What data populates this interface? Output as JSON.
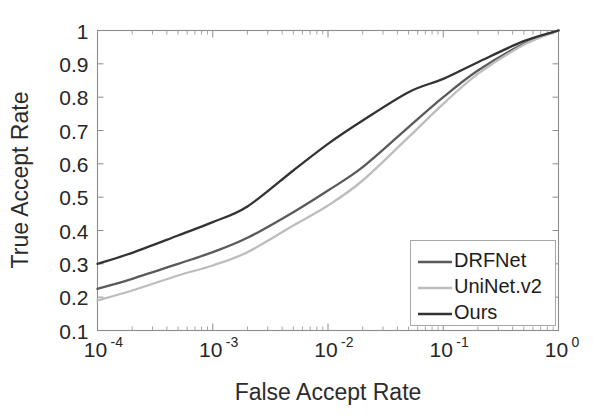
{
  "chart_data": {
    "type": "line",
    "title": "",
    "xlabel": "False Accept Rate",
    "ylabel": "True Accept Rate",
    "xscale": "log",
    "yscale": "linear",
    "xlim": [
      0.0001,
      1
    ],
    "ylim": [
      0.1,
      1
    ],
    "grid": false,
    "legend_position": "lower right",
    "x_tick_labels": [
      "10⁻⁴",
      "10⁻³",
      "10⁻²",
      "10⁻¹",
      "10⁰"
    ],
    "x_tick_mantissa": [
      "10",
      "10",
      "10",
      "10",
      "10"
    ],
    "x_tick_exponents": [
      "-4",
      "-3",
      "-2",
      "-1",
      "0"
    ],
    "x_tick_values": [
      0.0001,
      0.001,
      0.01,
      0.1,
      1
    ],
    "y_tick_labels": [
      "0.1",
      "0.2",
      "0.3",
      "0.4",
      "0.5",
      "0.6",
      "0.7",
      "0.8",
      "0.9",
      "1"
    ],
    "y_tick_values": [
      0.1,
      0.2,
      0.3,
      0.4,
      0.5,
      0.6,
      0.7,
      0.8,
      0.9,
      1.0
    ],
    "x": [
      0.0001,
      0.0002,
      0.0005,
      0.001,
      0.002,
      0.005,
      0.01,
      0.02,
      0.05,
      0.1,
      0.2,
      0.5,
      1.0
    ],
    "series": [
      {
        "name": "DRFNet",
        "color": "#5a5a5a",
        "values": [
          0.225,
          0.255,
          0.3,
          0.335,
          0.378,
          0.455,
          0.52,
          0.59,
          0.71,
          0.8,
          0.88,
          0.96,
          1.0
        ]
      },
      {
        "name": "UniNet.v2",
        "color": "#bdbdbd",
        "values": [
          0.19,
          0.22,
          0.265,
          0.295,
          0.335,
          0.415,
          0.475,
          0.55,
          0.68,
          0.78,
          0.87,
          0.957,
          1.0
        ]
      },
      {
        "name": "Ours",
        "color": "#333333",
        "values": [
          0.3,
          0.333,
          0.385,
          0.425,
          0.472,
          0.58,
          0.66,
          0.73,
          0.815,
          0.855,
          0.905,
          0.968,
          1.0
        ]
      }
    ]
  },
  "legend": {
    "entries": [
      {
        "label": "DRFNet"
      },
      {
        "label": "UniNet.v2"
      },
      {
        "label": "Ours"
      }
    ]
  },
  "axes": {
    "x_title": "False Accept Rate",
    "y_title": "True Accept Rate"
  }
}
